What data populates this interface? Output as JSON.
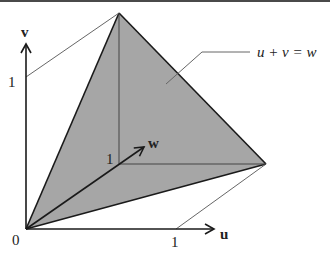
{
  "diagram": {
    "colors": {
      "fill": "#a6a6a6",
      "stroke": "#1a1a1a",
      "thin": "#555555",
      "border": "#4a4a4a"
    },
    "axes": {
      "u": {
        "label": "u",
        "tick_label": "1"
      },
      "v": {
        "label": "v",
        "tick_label": "1"
      },
      "w": {
        "label": "w",
        "tick_label": "1"
      }
    },
    "origin_label": "0",
    "plane_label": "u + v = w",
    "vertices": [
      {
        "name": "origin",
        "coords": [
          0,
          0,
          0
        ]
      },
      {
        "name": "u-w-vertex",
        "coords": [
          1,
          0,
          1
        ]
      },
      {
        "name": "v-w-vertex",
        "coords": [
          0,
          1,
          1
        ]
      },
      {
        "name": "w-unit",
        "coords": [
          0,
          0,
          1
        ]
      }
    ]
  }
}
